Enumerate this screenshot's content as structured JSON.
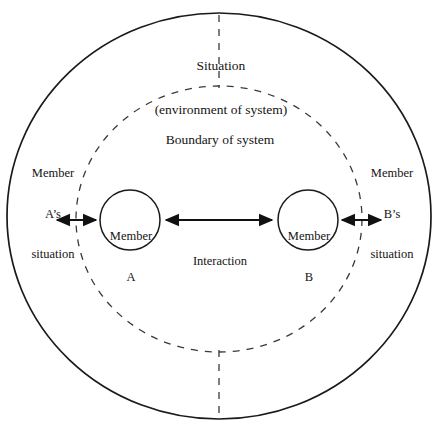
{
  "diagram": {
    "title_top": {
      "line1": "Situation",
      "line2": "(environment of system)"
    },
    "boundary_label": "Boundary of system",
    "left_region_label": {
      "line1": "Member",
      "line2": "A’s",
      "line3": "situation"
    },
    "right_region_label": {
      "line1": "Member",
      "line2": "B’s",
      "line3": "situation"
    },
    "node_a": {
      "line1": "Member",
      "line2": "A"
    },
    "node_b": {
      "line1": "Member",
      "line2": "B"
    },
    "interaction_label": "Interaction",
    "colors": {
      "stroke": "#1a1a1a",
      "dashed_stroke": "#3a3a3a",
      "background": "#ffffff",
      "text": "#141414"
    },
    "geometry": {
      "outer_ellipse": {
        "cx": 219,
        "cy": 216,
        "rx": 212,
        "ry": 203
      },
      "dashed_ellipse": {
        "cx": 219,
        "cy": 219,
        "rx": 143,
        "ry": 133
      },
      "node_a_circle": {
        "cx": 130,
        "cy": 220,
        "r": 30
      },
      "node_b_circle": {
        "cx": 308,
        "cy": 220,
        "r": 30
      }
    }
  }
}
